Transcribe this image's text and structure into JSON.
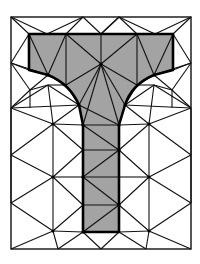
{
  "diagram": {
    "title": "",
    "colors": {
      "background": "#ffffff",
      "fill": "#a3a3a3",
      "edge": "#111111",
      "boundary": "#000000"
    },
    "outer_rect": {
      "x": 11,
      "y": 17,
      "w": 180,
      "h": 232
    },
    "t_shape_outline": "M29,34 L173,34 L173,70 L154,75 Q132,84 125,105 L119,125 L119,232 L83,232 L83,125 L79,105 Q70,84 48,75 L29,70 Z",
    "mesh_edges": [
      [
        11,
        17,
        47,
        34
      ],
      [
        47,
        34,
        83,
        17
      ],
      [
        83,
        17,
        101,
        34
      ],
      [
        101,
        34,
        119,
        17
      ],
      [
        119,
        17,
        155,
        34
      ],
      [
        155,
        34,
        173,
        34
      ],
      [
        155,
        34,
        191,
        17
      ],
      [
        119,
        17,
        101,
        34
      ],
      [
        11,
        17,
        29,
        34
      ],
      [
        47,
        34,
        29,
        34
      ],
      [
        191,
        17,
        173,
        34
      ],
      [
        47,
        34,
        66,
        34
      ],
      [
        83,
        17,
        66,
        34
      ],
      [
        137,
        34,
        119,
        17
      ],
      [
        29,
        34,
        11,
        63
      ],
      [
        29,
        70,
        11,
        63
      ],
      [
        11,
        63,
        48,
        75
      ],
      [
        173,
        34,
        191,
        63
      ],
      [
        173,
        70,
        191,
        63
      ],
      [
        191,
        63,
        154,
        75
      ],
      [
        66,
        34,
        101,
        64
      ],
      [
        101,
        34,
        101,
        64
      ],
      [
        137,
        34,
        101,
        64
      ],
      [
        29,
        34,
        48,
        75
      ],
      [
        66,
        34,
        48,
        75
      ],
      [
        173,
        34,
        154,
        75
      ],
      [
        137,
        34,
        154,
        75
      ],
      [
        66,
        34,
        66,
        85
      ],
      [
        137,
        34,
        137,
        85
      ],
      [
        48,
        75,
        66,
        85
      ],
      [
        154,
        75,
        137,
        85
      ],
      [
        66,
        85,
        101,
        64
      ],
      [
        137,
        85,
        101,
        64
      ],
      [
        66,
        85,
        79,
        105
      ],
      [
        137,
        85,
        125,
        105
      ],
      [
        101,
        64,
        79,
        105
      ],
      [
        101,
        64,
        125,
        105
      ],
      [
        101,
        64,
        83,
        125
      ],
      [
        101,
        64,
        119,
        125
      ],
      [
        79,
        105,
        119,
        125
      ],
      [
        11,
        63,
        30,
        90
      ],
      [
        30,
        90,
        48,
        75
      ],
      [
        30,
        90,
        48,
        85
      ],
      [
        48,
        85,
        66,
        85
      ],
      [
        48,
        85,
        79,
        105
      ],
      [
        11,
        108,
        48,
        85
      ],
      [
        11,
        108,
        53,
        124
      ],
      [
        48,
        85,
        53,
        124
      ],
      [
        53,
        124,
        79,
        105
      ],
      [
        11,
        108,
        79,
        105
      ],
      [
        191,
        63,
        172,
        90
      ],
      [
        172,
        90,
        154,
        75
      ],
      [
        172,
        90,
        154,
        85
      ],
      [
        154,
        85,
        137,
        85
      ],
      [
        154,
        85,
        125,
        105
      ],
      [
        191,
        108,
        154,
        85
      ],
      [
        191,
        108,
        149,
        124
      ],
      [
        154,
        85,
        149,
        124
      ],
      [
        149,
        124,
        125,
        105
      ],
      [
        191,
        108,
        125,
        105
      ],
      [
        30,
        90,
        30,
        108
      ],
      [
        172,
        90,
        172,
        108
      ],
      [
        30,
        90,
        11,
        108
      ],
      [
        172,
        90,
        191,
        108
      ],
      [
        53,
        124,
        83,
        125
      ],
      [
        149,
        124,
        119,
        125
      ],
      [
        53,
        124,
        53,
        177
      ],
      [
        149,
        124,
        149,
        177
      ],
      [
        11,
        155,
        53,
        124
      ],
      [
        191,
        155,
        149,
        124
      ],
      [
        11,
        108,
        11,
        155
      ],
      [
        191,
        108,
        191,
        155
      ],
      [
        53,
        124,
        83,
        150
      ],
      [
        149,
        124,
        119,
        150
      ],
      [
        83,
        125,
        119,
        125
      ],
      [
        83,
        150,
        119,
        150
      ],
      [
        83,
        177,
        119,
        177
      ],
      [
        83,
        205,
        119,
        205
      ],
      [
        83,
        125,
        119,
        150
      ],
      [
        119,
        150,
        83,
        177
      ],
      [
        83,
        177,
        119,
        205
      ],
      [
        119,
        205,
        83,
        232
      ],
      [
        11,
        155,
        53,
        177
      ],
      [
        53,
        177,
        83,
        177
      ],
      [
        53,
        177,
        83,
        150
      ],
      [
        11,
        203,
        53,
        177
      ],
      [
        53,
        177,
        83,
        205
      ],
      [
        11,
        203,
        53,
        231
      ],
      [
        53,
        231,
        83,
        205
      ],
      [
        53,
        231,
        83,
        232
      ],
      [
        11,
        249,
        53,
        231
      ],
      [
        53,
        231,
        58,
        249
      ],
      [
        58,
        249,
        83,
        232
      ],
      [
        83,
        232,
        101,
        249
      ],
      [
        101,
        249,
        119,
        232
      ],
      [
        119,
        232,
        146,
        249
      ],
      [
        191,
        155,
        149,
        177
      ],
      [
        149,
        177,
        119,
        177
      ],
      [
        149,
        177,
        119,
        150
      ],
      [
        191,
        203,
        149,
        177
      ],
      [
        149,
        177,
        119,
        205
      ],
      [
        191,
        203,
        149,
        231
      ],
      [
        149,
        231,
        119,
        205
      ],
      [
        149,
        231,
        119,
        232
      ],
      [
        191,
        249,
        149,
        231
      ],
      [
        149,
        231,
        146,
        249
      ],
      [
        11,
        155,
        11,
        203
      ],
      [
        191,
        155,
        191,
        203
      ],
      [
        53,
        177,
        53,
        231
      ],
      [
        149,
        177,
        149,
        231
      ]
    ],
    "nodes": [
      [
        101,
        64
      ],
      [
        48,
        75
      ],
      [
        154,
        75
      ],
      [
        79,
        105
      ],
      [
        125,
        105
      ],
      [
        83,
        125
      ],
      [
        119,
        125
      ],
      [
        53,
        124
      ],
      [
        149,
        124
      ],
      [
        119,
        150
      ],
      [
        83,
        177
      ],
      [
        119,
        205
      ],
      [
        83,
        232
      ],
      [
        53,
        177
      ],
      [
        149,
        177
      ],
      [
        53,
        231
      ],
      [
        149,
        231
      ]
    ]
  }
}
